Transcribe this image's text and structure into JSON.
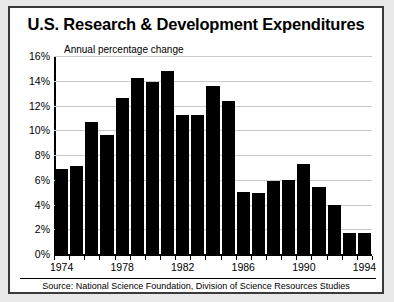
{
  "chart_data": {
    "type": "bar",
    "title": "U.S. Research & Development Expenditures",
    "subtitle": "Annual percentage change",
    "source": "Source: National Science Foundation, Division of Science Resources Studies",
    "xlabel": "",
    "ylabel": "",
    "ylim": [
      0,
      16
    ],
    "ytick_labels": [
      "16%",
      "14%",
      "12%",
      "10%",
      "8%",
      "6%",
      "4%",
      "2%",
      "0%"
    ],
    "ytick_values": [
      16,
      14,
      12,
      10,
      8,
      6,
      4,
      2,
      0
    ],
    "grid": true,
    "legend": "none",
    "bar_color": "#000000",
    "categories": [
      "1974",
      "1975",
      "1976",
      "1977",
      "1978",
      "1979",
      "1980",
      "1981",
      "1982",
      "1983",
      "1984",
      "1985",
      "1986",
      "1987",
      "1988",
      "1989",
      "1990",
      "1991",
      "1992",
      "1993",
      "1994"
    ],
    "values": [
      6.9,
      7.1,
      10.7,
      9.6,
      12.6,
      14.2,
      13.9,
      14.8,
      11.2,
      11.2,
      13.6,
      12.4,
      5.0,
      4.9,
      5.9,
      6.0,
      7.3,
      5.4,
      4.0,
      1.7,
      1.7
    ],
    "xtick_labels": [
      "1974",
      "1978",
      "1982",
      "1986",
      "1990",
      "1994"
    ],
    "xtick_categories": [
      "1974",
      "1978",
      "1982",
      "1986",
      "1990",
      "1994"
    ]
  }
}
